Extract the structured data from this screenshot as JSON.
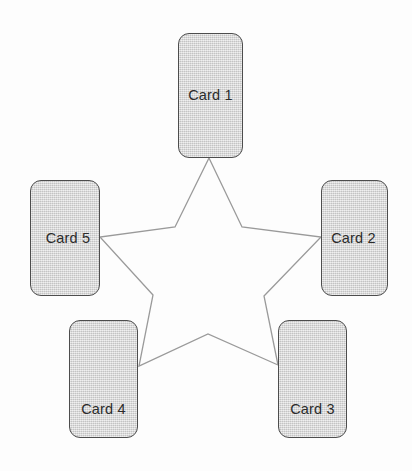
{
  "diagram": {
    "background_color": "#fdfdfd",
    "card_fill_color": "#d2d2d2",
    "card_border_color": "#4d4d4d",
    "label_color": "#2b2b2b",
    "star_stroke_color": "#9a9a9a",
    "star_fill": "none",
    "cards": [
      {
        "id": "card-1",
        "label": "Card 1",
        "position": "top"
      },
      {
        "id": "card-2",
        "label": "Card 2",
        "position": "right"
      },
      {
        "id": "card-3",
        "label": "Card 3",
        "position": "bottom-right"
      },
      {
        "id": "card-4",
        "label": "Card 4",
        "position": "bottom-left"
      },
      {
        "id": "card-5",
        "label": "Card 5",
        "position": "left"
      }
    ],
    "star": {
      "points": 5,
      "outer_vertices": [
        {
          "x": 209,
          "y": 158
        },
        {
          "x": 321,
          "y": 237
        },
        {
          "x": 278,
          "y": 365
        },
        {
          "x": 139,
          "y": 366
        },
        {
          "x": 100,
          "y": 237
        }
      ],
      "inner_vertices": [
        {
          "x": 242,
          "y": 227
        },
        {
          "x": 264,
          "y": 296
        },
        {
          "x": 208,
          "y": 334
        },
        {
          "x": 153,
          "y": 295
        },
        {
          "x": 175,
          "y": 227
        }
      ]
    }
  }
}
